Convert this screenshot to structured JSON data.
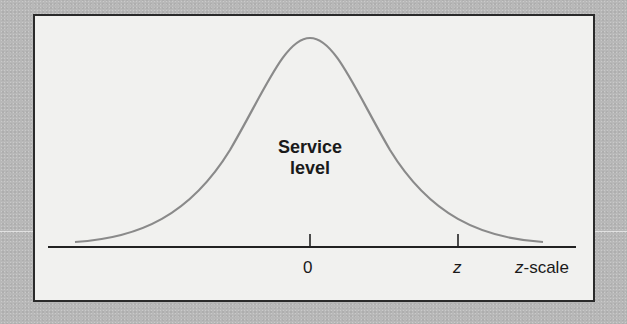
{
  "diagram": {
    "type": "normal-distribution",
    "curve_label_line1": "Service",
    "curve_label_line2": "level",
    "x_axis": {
      "ticks": [
        {
          "label": "0",
          "italic": false
        },
        {
          "label": "z",
          "italic": true
        }
      ],
      "axis_label_var": "z",
      "axis_label_suffix": "-scale"
    },
    "colors": {
      "background": "#b8b8b8",
      "panel": "#f1f1ef",
      "border": "#2a2a2a",
      "curve": "#8a8a8a",
      "axis": "#222222"
    }
  }
}
